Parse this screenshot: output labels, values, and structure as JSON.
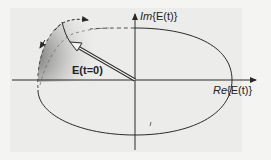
{
  "diagram": {
    "type": "phasor-ellipse",
    "axes": {
      "x_label_prefix": "Re",
      "x_label_arg": "{E(t)}",
      "y_label_prefix": "Im",
      "y_label_arg": "{E(t)}"
    },
    "vector_label": "E(t=0)",
    "colors": {
      "line": "#2a2a2a",
      "background": "#f4f4f2",
      "panel": "#ececea",
      "shadow": "#6a6a6a"
    }
  }
}
